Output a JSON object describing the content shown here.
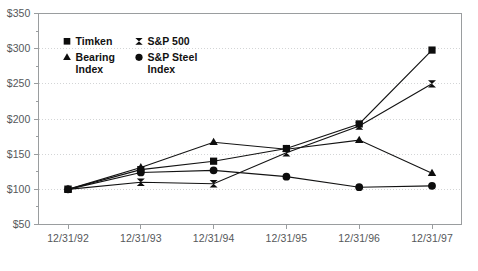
{
  "chart_data": {
    "type": "line",
    "title": "",
    "subtitle": "",
    "xlabel": "",
    "ylabel": "",
    "categories": [
      "12/31/92",
      "12/31/93",
      "12/31/94",
      "12/31/95",
      "12/31/96",
      "12/31/97"
    ],
    "ylim": [
      50,
      350
    ],
    "ytick_values": [
      50,
      100,
      150,
      200,
      250,
      300,
      350
    ],
    "ytick_labels": [
      "$50",
      "$100",
      "$150",
      "$200",
      "$250",
      "$300",
      "$350"
    ],
    "y_minor_ticks": [
      75,
      125,
      175,
      225,
      275,
      325
    ],
    "grid": true,
    "grid_axis": "y",
    "legend_position": "upper-left-inside",
    "series": [
      {
        "name": "Timken",
        "marker": "square",
        "values": [
          100,
          128,
          140,
          158,
          193,
          298
        ]
      },
      {
        "name": "S&P 500",
        "marker": "bowtie",
        "values": [
          100,
          110,
          108,
          152,
          190,
          250
        ]
      },
      {
        "name": "Bearing Index",
        "marker": "triangle",
        "values": [
          100,
          131,
          167,
          157,
          170,
          123
        ]
      },
      {
        "name": "S&P Steel Index",
        "marker": "circle",
        "values": [
          100,
          124,
          127,
          118,
          103,
          105
        ]
      }
    ]
  },
  "legend": {
    "entries": [
      {
        "label": "Timken",
        "label_line2": "",
        "marker": "square"
      },
      {
        "label": "S&P 500",
        "label_line2": "",
        "marker": "bowtie"
      },
      {
        "label": "Bearing",
        "label_line2": "Index",
        "marker": "triangle"
      },
      {
        "label": "S&P Steel",
        "label_line2": "Index",
        "marker": "circle"
      }
    ]
  },
  "colors": {
    "series": "#131313",
    "frame": "#9a9d9f",
    "grid": "#d3d5d6",
    "tick_text": "#55585a",
    "legend_text": "#111111",
    "background": "#ffffff"
  }
}
